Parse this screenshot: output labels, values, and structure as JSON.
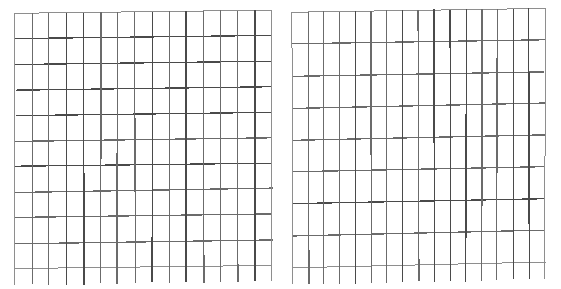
{
  "page": {
    "background_color": "#ffffff",
    "width": 561,
    "height": 289
  },
  "style": {
    "line_color": "#6b6b6b",
    "line_color_light": "#8e8e8e",
    "line_color_dark": "#4a4a4a",
    "line_width_minor": 1.0,
    "line_width_major": 1.3
  },
  "figures": [
    {
      "name": "left-grid",
      "label": "Left grid",
      "x": 15,
      "y": 13,
      "width": 257,
      "height": 256,
      "columns": 15,
      "rows": 10,
      "cell_width": 17.1,
      "cell_height": 25.6,
      "overhang_bottom": 16,
      "skew_top_px": -3,
      "skew_bottom_px": -4,
      "has_bottom_border": true,
      "has_top_border": true,
      "has_left_border": true,
      "has_right_border": true
    },
    {
      "name": "right-grid",
      "label": "Right grid",
      "x": 292,
      "y": 12,
      "width": 253,
      "height": 256,
      "columns": 16,
      "rows": 8,
      "cell_width": 15.8,
      "cell_height": 32.0,
      "overhang_bottom": 17,
      "skew_top_px": -4,
      "skew_bottom_px": -6,
      "has_bottom_border": true,
      "has_top_border": true,
      "has_left_border": true,
      "has_right_border": true
    }
  ],
  "chart_data": {
    "type": "table",
    "xlabel": "",
    "ylabel": "",
    "grid": true,
    "legend": "none",
    "annotations": [],
    "panels": [
      {
        "name": "left-grid",
        "columns": 15,
        "rows": 10,
        "total_cells": 150,
        "cell_values": []
      },
      {
        "name": "right-grid",
        "columns": 16,
        "rows": 8,
        "total_cells": 128,
        "cell_values": []
      }
    ]
  }
}
